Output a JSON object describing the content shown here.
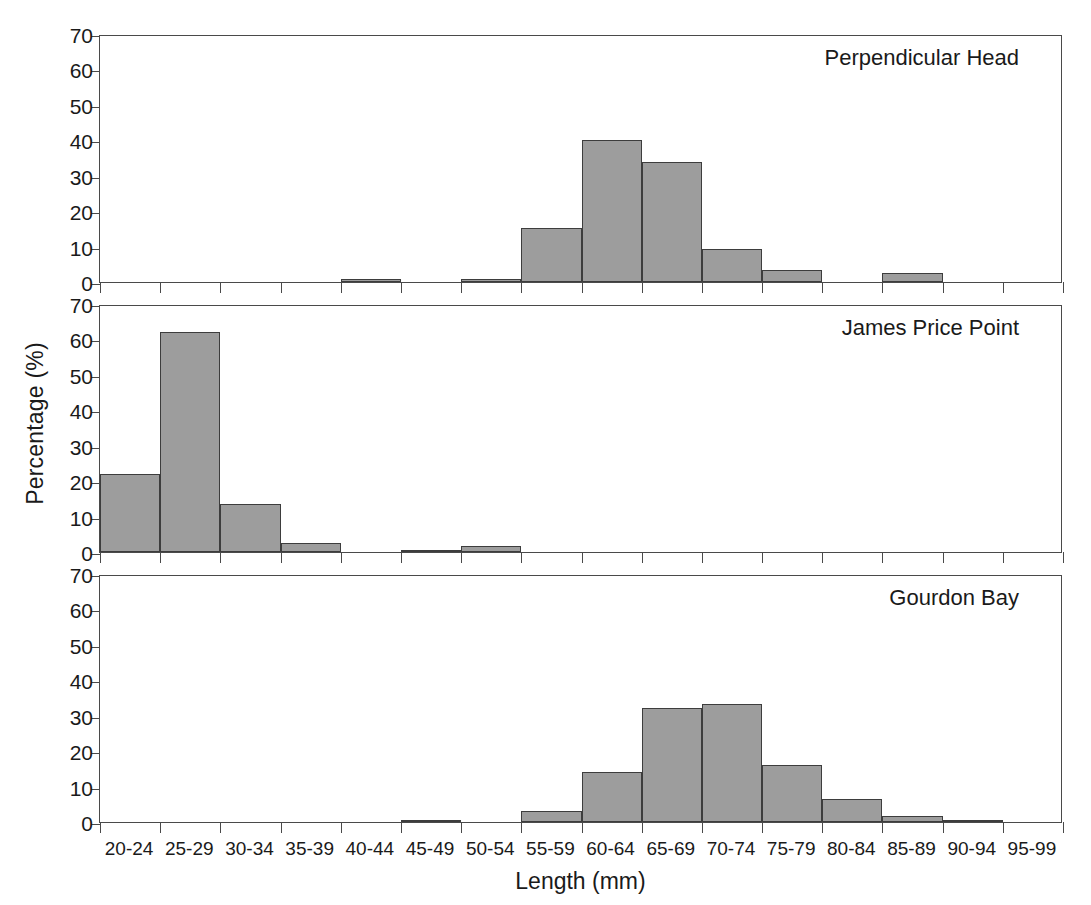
{
  "chart_data": {
    "type": "bar",
    "title": "",
    "xlabel": "Length (mm)",
    "ylabel": "Percentage (%)",
    "ylim": [
      0,
      70
    ],
    "yticks": [
      0,
      10,
      20,
      30,
      40,
      50,
      60,
      70
    ],
    "grid": false,
    "legend": "none",
    "layout": "3 stacked panels sharing one x-axis",
    "categories": [
      "20-24",
      "25-29",
      "30-34",
      "35-39",
      "40-44",
      "45-49",
      "50-54",
      "55-59",
      "60-64",
      "65-69",
      "70-74",
      "75-79",
      "80-84",
      "85-89",
      "90-94",
      "95-99"
    ],
    "panels": [
      {
        "label": "Perpendicular Head",
        "values": [
          0,
          0,
          0,
          0,
          0.8,
          0,
          0.8,
          15.2,
          40.0,
          34.0,
          9.2,
          3.4,
          0,
          2.6,
          0,
          0
        ]
      },
      {
        "label": "James Price Point",
        "values": [
          22.0,
          62.0,
          13.5,
          2.5,
          0,
          0.5,
          1.7,
          0,
          0,
          0,
          0,
          0,
          0,
          0,
          0,
          0
        ]
      },
      {
        "label": "Gourdon Bay",
        "values": [
          0,
          0,
          0,
          0,
          0,
          0.4,
          0,
          3.0,
          14.0,
          32.3,
          33.3,
          16.0,
          6.4,
          1.6,
          0.5,
          0
        ]
      }
    ]
  },
  "style": {
    "bar_fill": "#9d9d9d",
    "bar_stroke": "#3d3d3d",
    "axis_color": "#4a4a4a",
    "text_color": "#1a1a1a",
    "background": "#ffffff"
  }
}
